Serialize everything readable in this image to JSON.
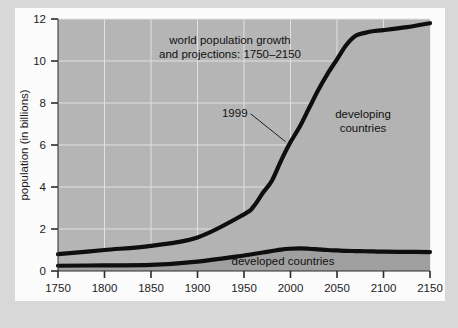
{
  "figure": {
    "outer_background": "#d9d9d9",
    "card_background": "#fdfdfd"
  },
  "chart_data": {
    "type": "area",
    "title_line1": "world population growth",
    "title_line2": "and projections: 1750–2150",
    "xlabel": "year",
    "ylabel": "population (in billions)",
    "xlim": [
      1750,
      2150
    ],
    "ylim": [
      0,
      12
    ],
    "grid": true,
    "legend_position": "inline-labels",
    "xticks": [
      1750,
      1800,
      1850,
      1900,
      1950,
      2000,
      2050,
      2100,
      2150
    ],
    "xtick_labels": [
      "1750",
      "1800",
      "1850",
      "1900",
      "1950",
      "2000",
      "2050",
      "2100",
      "2150"
    ],
    "yticks": [
      0,
      2,
      4,
      6,
      8,
      10,
      12
    ],
    "ytick_labels": [
      "0",
      "2",
      "4",
      "6",
      "8",
      "10",
      "12"
    ],
    "x": [
      1750,
      1800,
      1850,
      1900,
      1950,
      1960,
      1970,
      1980,
      1990,
      1999,
      2010,
      2020,
      2030,
      2040,
      2050,
      2060,
      2070,
      2080,
      2090,
      2100,
      2125,
      2150
    ],
    "series": [
      {
        "name": "developed countries",
        "label": "developed countries",
        "color": "#a0a0a0",
        "values": [
          0.25,
          0.27,
          0.29,
          0.45,
          0.74,
          0.81,
          0.88,
          0.95,
          1.02,
          1.06,
          1.08,
          1.06,
          1.03,
          1.0,
          0.98,
          0.96,
          0.95,
          0.94,
          0.93,
          0.92,
          0.91,
          0.9
        ]
      },
      {
        "name": "developing countries",
        "label": "developing countries",
        "color": "#b4b4b4",
        "values": [
          0.55,
          0.73,
          0.91,
          1.15,
          1.96,
          2.25,
          2.82,
          3.35,
          4.25,
          5.0,
          5.8,
          6.7,
          7.6,
          8.4,
          9.1,
          9.8,
          10.25,
          10.4,
          10.5,
          10.55,
          10.7,
          10.9
        ]
      }
    ],
    "total_label": "world total",
    "total_values": [
      0.8,
      1.0,
      1.2,
      1.6,
      2.7,
      3.06,
      3.7,
      4.3,
      5.27,
      6.06,
      6.88,
      7.76,
      8.63,
      9.4,
      10.08,
      10.76,
      11.2,
      11.34,
      11.43,
      11.47,
      11.61,
      11.8
    ],
    "annotations": [
      {
        "text": "1999",
        "x": 1999,
        "y": 6.06,
        "note": "leader line from label to world total curve"
      }
    ]
  }
}
